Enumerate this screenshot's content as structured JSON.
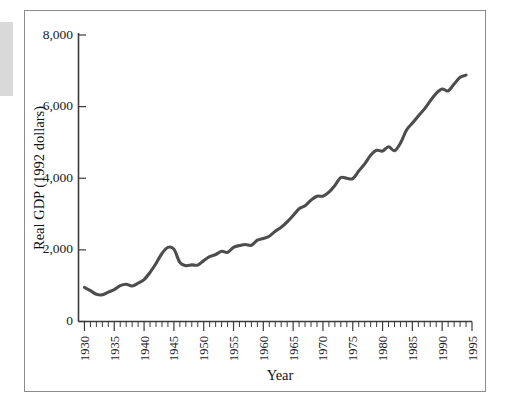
{
  "figure": {
    "background_color": "#ffffff",
    "frame_color": "#8c8c8c",
    "line_color": "#4d4d4d",
    "text_color": "#1a1a1a"
  },
  "chart_data": {
    "type": "line",
    "title": "",
    "subtitle": "",
    "xlabel": "Year",
    "ylabel": "Real GDP (1992 dollars)",
    "xlim": [
      1929,
      1995
    ],
    "ylim": [
      0,
      8000
    ],
    "grid": false,
    "legend": null,
    "x_tick_labels": [
      "1930",
      "1935",
      "1940",
      "1945",
      "1950",
      "1955",
      "1960",
      "1965",
      "1970",
      "1975",
      "1980",
      "1985",
      "1990",
      "1995"
    ],
    "x_major_ticks": [
      1930,
      1935,
      1940,
      1945,
      1950,
      1955,
      1960,
      1965,
      1970,
      1975,
      1980,
      1985,
      1990,
      1995
    ],
    "x_minor_tick_interval": 1,
    "y_tick_labels": [
      "0",
      "2,000",
      "4,000",
      "6,000",
      "8,000"
    ],
    "y_major_ticks": [
      0,
      2000,
      4000,
      6000,
      8000
    ],
    "x_tick_label_rotation": -90,
    "series": [
      {
        "name": "Real GDP (1992 dollars)",
        "color": "#4d4d4d",
        "x": [
          1930,
          1931,
          1932,
          1933,
          1934,
          1935,
          1936,
          1937,
          1938,
          1939,
          1940,
          1941,
          1942,
          1943,
          1944,
          1945,
          1946,
          1947,
          1948,
          1949,
          1950,
          1951,
          1952,
          1953,
          1954,
          1955,
          1956,
          1957,
          1958,
          1959,
          1960,
          1961,
          1962,
          1963,
          1964,
          1965,
          1966,
          1967,
          1968,
          1969,
          1970,
          1971,
          1972,
          1973,
          1974,
          1975,
          1976,
          1977,
          1978,
          1979,
          1980,
          1981,
          1982,
          1983,
          1984,
          1985,
          1986,
          1987,
          1988,
          1989,
          1990,
          1991,
          1992,
          1993,
          1994
        ],
        "y": [
          950,
          860,
          760,
          745,
          820,
          890,
          1000,
          1040,
          990,
          1070,
          1170,
          1370,
          1620,
          1900,
          2070,
          2020,
          1650,
          1560,
          1580,
          1575,
          1700,
          1810,
          1870,
          1960,
          1930,
          2070,
          2120,
          2150,
          2130,
          2270,
          2320,
          2380,
          2520,
          2630,
          2780,
          2960,
          3150,
          3230,
          3390,
          3500,
          3500,
          3610,
          3800,
          4020,
          4000,
          3990,
          4200,
          4400,
          4640,
          4780,
          4760,
          4880,
          4770,
          4980,
          5340,
          5540,
          5740,
          5930,
          6160,
          6370,
          6490,
          6440,
          6630,
          6820,
          6880
        ],
        "units": "billions of 1992 dollars"
      }
    ],
    "annotations": []
  }
}
